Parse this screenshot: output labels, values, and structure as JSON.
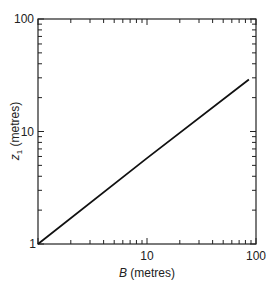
{
  "chart_data": {
    "type": "line",
    "title": "",
    "xlabel": "B (metres)",
    "ylabel": "z1 (metres)",
    "xscale": "log",
    "yscale": "log",
    "xlim": [
      1,
      100
    ],
    "ylim": [
      1,
      100
    ],
    "x_ticks": [
      "10",
      "100"
    ],
    "y_ticks": [
      "1",
      "10",
      "100"
    ],
    "grid": false,
    "series": [
      {
        "name": "z1 vs B",
        "x": [
          1,
          10,
          86
        ],
        "y": [
          1,
          5.8,
          29
        ]
      }
    ]
  },
  "labels": {
    "x_axis_italic": "B",
    "x_axis_rest": " (metres)",
    "y_axis_italic": "z",
    "y_axis_sub": "1",
    "y_axis_rest": " (metres)",
    "ytick_100": "100",
    "ytick_10": "10",
    "ytick_1": "1",
    "xtick_10": "10",
    "xtick_100": "100"
  }
}
